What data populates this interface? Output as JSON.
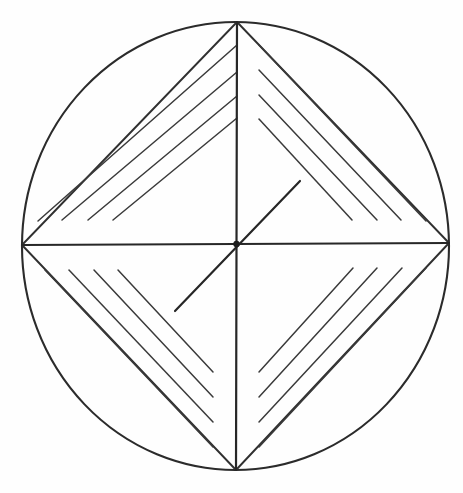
{
  "figure": {
    "title": "Circle with inscribed square and quadrant hatching",
    "background_color": "#fefefe",
    "ink_color": "#2b2b2b"
  },
  "geometry": {
    "canvas": {
      "width": 463,
      "height": 493
    },
    "circle": {
      "name": "outer-circle",
      "center_x": 235.5,
      "center_y": 246.0,
      "radius_x": 213.5,
      "radius_y": 224.0,
      "stroke_width": 2.1
    },
    "axes": [
      {
        "name": "horizontal-diameter",
        "x1": 22.0,
        "y1": 245.0,
        "x2": 449.0,
        "y2": 243.0
      },
      {
        "name": "vertical-diameter",
        "x1": 237.0,
        "y1": 22.0,
        "x2": 236.0,
        "y2": 470.0
      }
    ],
    "cardinal_points": {
      "top": {
        "x": 237.0,
        "y": 22.0
      },
      "right": {
        "x": 449.0,
        "y": 243.0
      },
      "bottom": {
        "x": 236.0,
        "y": 470.0
      },
      "left": {
        "x": 22.0,
        "y": 245.0
      }
    },
    "center_point": {
      "name": "center-vertex",
      "x": 236.5,
      "y": 244.0,
      "dot_radius": 3.2
    },
    "radial_line": {
      "name": "diagonal-radius",
      "x1": 175.0,
      "y1": 311.0,
      "x2": 300.0,
      "y2": 181.0,
      "stroke_width": 2.2
    }
  },
  "quadrants": [
    {
      "name": "quadrant-top-left",
      "label": "Top-left quadrant",
      "hatch_direction": "lower-left to upper-right",
      "line_count": 5,
      "chord": {
        "x1": 22.0,
        "y1": 245.0,
        "x2": 237.0,
        "y2": 22.0
      },
      "hatch_lines": [
        {
          "x1": 22.0,
          "y1": 245.0,
          "x2": 237.0,
          "y2": 22.0
        },
        {
          "x1": 38.0,
          "y1": 221.0,
          "x2": 237.0,
          "y2": 45.0
        },
        {
          "x1": 62.0,
          "y1": 220.0,
          "x2": 237.0,
          "y2": 72.0
        },
        {
          "x1": 88.0,
          "y1": 220.0,
          "x2": 237.0,
          "y2": 96.0
        },
        {
          "x1": 113.0,
          "y1": 220.0,
          "x2": 237.0,
          "y2": 118.0
        }
      ]
    },
    {
      "name": "quadrant-top-right",
      "label": "Top-right quadrant",
      "hatch_direction": "upper-left to lower-right",
      "line_count": 5,
      "chord": {
        "x1": 237.0,
        "y1": 22.0,
        "x2": 449.0,
        "y2": 243.0
      },
      "hatch_lines": [
        {
          "x1": 237.0,
          "y1": 22.0,
          "x2": 449.0,
          "y2": 243.0
        },
        {
          "x1": 259.0,
          "y1": 45.0,
          "x2": 426.0,
          "y2": 221.0
        },
        {
          "x1": 259.0,
          "y1": 70.0,
          "x2": 401.0,
          "y2": 220.0
        },
        {
          "x1": 259.0,
          "y1": 95.0,
          "x2": 377.0,
          "y2": 220.0
        },
        {
          "x1": 259.0,
          "y1": 119.0,
          "x2": 352.0,
          "y2": 220.0
        }
      ]
    },
    {
      "name": "quadrant-bottom-left",
      "label": "Bottom-left quadrant",
      "hatch_direction": "upper-left to lower-right",
      "line_count": 5,
      "chord": {
        "x1": 22.0,
        "y1": 245.0,
        "x2": 236.0,
        "y2": 470.0
      },
      "hatch_lines": [
        {
          "x1": 22.0,
          "y1": 245.0,
          "x2": 236.0,
          "y2": 470.0
        },
        {
          "x1": 45.0,
          "y1": 270.0,
          "x2": 213.0,
          "y2": 447.0
        },
        {
          "x1": 69.0,
          "y1": 270.0,
          "x2": 213.0,
          "y2": 422.0
        },
        {
          "x1": 94.0,
          "y1": 270.0,
          "x2": 213.0,
          "y2": 397.0
        },
        {
          "x1": 118.0,
          "y1": 270.0,
          "x2": 213.0,
          "y2": 372.0
        }
      ]
    },
    {
      "name": "quadrant-bottom-right",
      "label": "Bottom-right quadrant",
      "hatch_direction": "lower-left to upper-right",
      "line_count": 5,
      "chord": {
        "x1": 236.0,
        "y1": 470.0,
        "x2": 449.0,
        "y2": 243.0
      },
      "hatch_lines": [
        {
          "x1": 236.0,
          "y1": 470.0,
          "x2": 449.0,
          "y2": 243.0
        },
        {
          "x1": 259.0,
          "y1": 447.0,
          "x2": 426.0,
          "y2": 268.0
        },
        {
          "x1": 259.0,
          "y1": 422.0,
          "x2": 402.0,
          "y2": 268.0
        },
        {
          "x1": 259.0,
          "y1": 397.0,
          "x2": 377.0,
          "y2": 268.0
        },
        {
          "x1": 259.0,
          "y1": 372.0,
          "x2": 353.0,
          "y2": 268.0
        }
      ]
    }
  ]
}
